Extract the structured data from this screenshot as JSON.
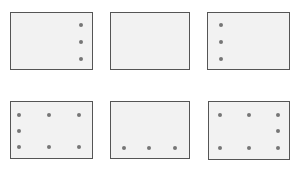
{
  "colors": {
    "background": "#ffffff",
    "panel_fill": "#f2f2f2",
    "panel_border": "#555555",
    "dot": "#767676"
  },
  "panels": [
    {
      "name": "panel-1",
      "rect": {
        "x": 10,
        "y": 12,
        "w": 83,
        "h": 58
      },
      "dots": [
        {
          "x": 81,
          "y": 25
        },
        {
          "x": 81,
          "y": 42
        },
        {
          "x": 81,
          "y": 59
        }
      ]
    },
    {
      "name": "panel-2",
      "rect": {
        "x": 110,
        "y": 12,
        "w": 80,
        "h": 58
      },
      "dots": []
    },
    {
      "name": "panel-3",
      "rect": {
        "x": 207,
        "y": 12,
        "w": 83,
        "h": 58
      },
      "dots": [
        {
          "x": 221,
          "y": 25
        },
        {
          "x": 221,
          "y": 42
        },
        {
          "x": 221,
          "y": 59
        }
      ]
    },
    {
      "name": "panel-4",
      "rect": {
        "x": 10,
        "y": 101,
        "w": 83,
        "h": 58
      },
      "dots": [
        {
          "x": 19,
          "y": 115
        },
        {
          "x": 49,
          "y": 115
        },
        {
          "x": 79,
          "y": 115
        },
        {
          "x": 19,
          "y": 131
        },
        {
          "x": 19,
          "y": 147
        },
        {
          "x": 49,
          "y": 147
        },
        {
          "x": 79,
          "y": 147
        }
      ]
    },
    {
      "name": "panel-5",
      "rect": {
        "x": 110,
        "y": 101,
        "w": 80,
        "h": 58
      },
      "dots": [
        {
          "x": 124,
          "y": 148
        },
        {
          "x": 149,
          "y": 148
        },
        {
          "x": 175,
          "y": 148
        }
      ]
    },
    {
      "name": "panel-6",
      "rect": {
        "x": 208,
        "y": 101,
        "w": 82,
        "h": 59
      },
      "dots": [
        {
          "x": 220,
          "y": 115
        },
        {
          "x": 249,
          "y": 115
        },
        {
          "x": 278,
          "y": 115
        },
        {
          "x": 278,
          "y": 131
        },
        {
          "x": 220,
          "y": 148
        },
        {
          "x": 249,
          "y": 148
        },
        {
          "x": 278,
          "y": 148
        }
      ]
    }
  ]
}
